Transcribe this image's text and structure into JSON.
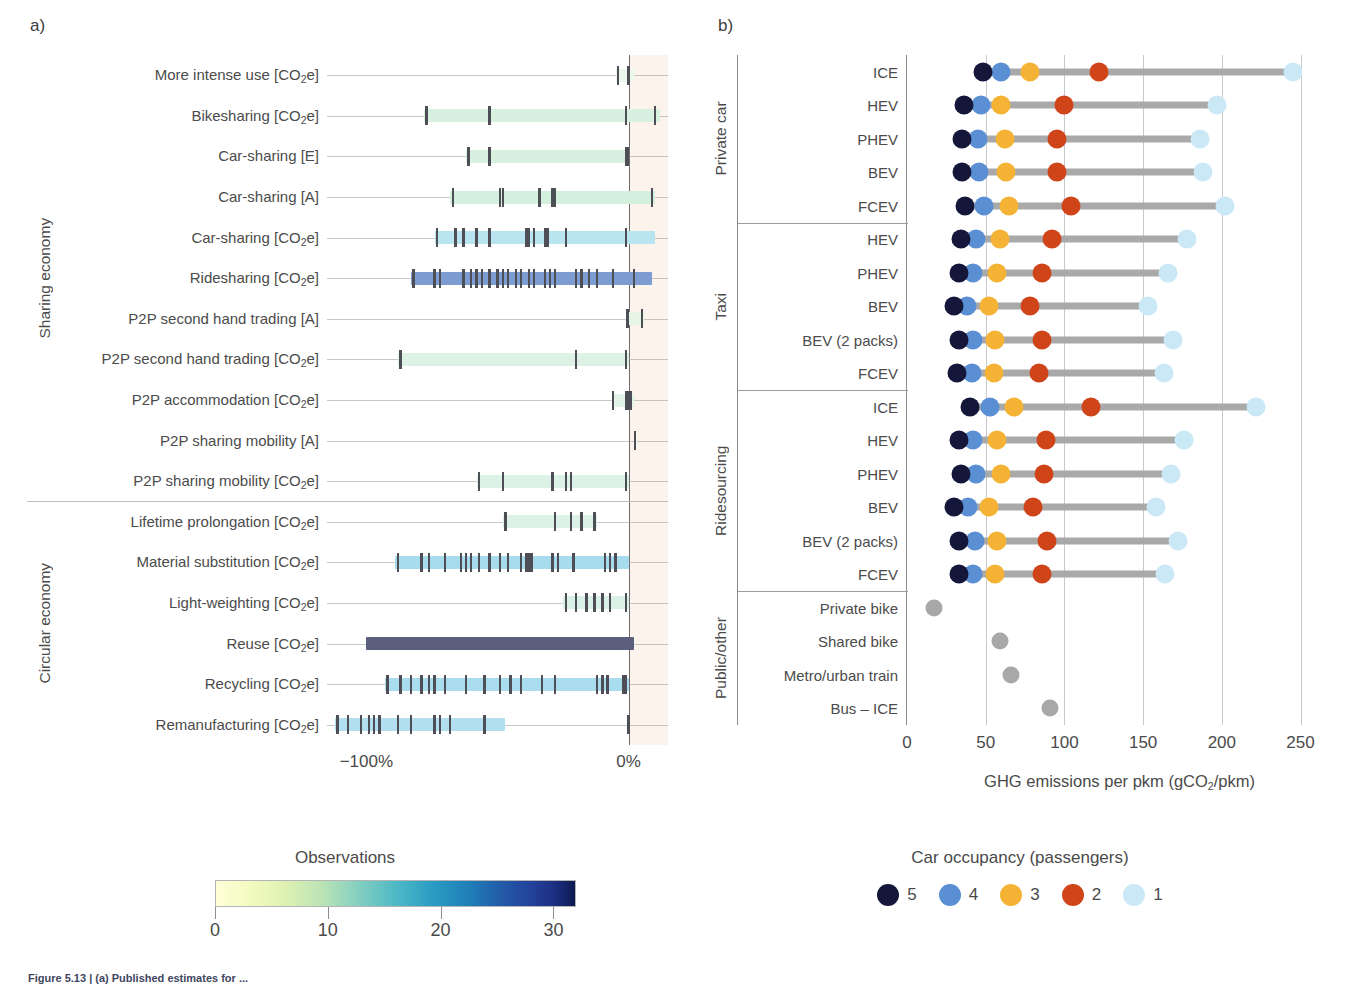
{
  "figure": {
    "panel_a_letter": "a)",
    "panel_b_letter": "b)",
    "caption": "Figure 5.13 | (a) Published estimates for ..."
  },
  "panel_a": {
    "x_ticks": [
      {
        "label": "−100%",
        "value": -100
      },
      {
        "label": "0%",
        "value": 0
      }
    ],
    "categories": [
      {
        "label": "Sharing economy",
        "rows": 11
      },
      {
        "label": "Circular economy",
        "rows": 6
      }
    ],
    "colorbar": {
      "title": "Observations",
      "ticks": [
        "0",
        "10",
        "20",
        "30"
      ],
      "tick_values": [
        0,
        10,
        20,
        30
      ],
      "vmax": 32,
      "colormap": "YlGnBu"
    }
  },
  "panel_b": {
    "x_label": "GHG emissions per pkm (gCO₂/pkm)",
    "x_ticks": [
      "0",
      "50",
      "100",
      "150",
      "200",
      "250"
    ],
    "x_tick_values": [
      0,
      50,
      100,
      150,
      200,
      250
    ],
    "groups": [
      {
        "label": "Private car",
        "rows": 5
      },
      {
        "label": "Taxi",
        "rows": 5
      },
      {
        "label": "Ridesourcing",
        "rows": 6
      },
      {
        "label": "Public/other",
        "rows": 4
      }
    ],
    "legend": {
      "title": "Car occupancy (passengers)",
      "entries": [
        {
          "label": "5",
          "color": "#14173a"
        },
        {
          "label": "4",
          "color": "#5b8fd4"
        },
        {
          "label": "3",
          "color": "#f5b335"
        },
        {
          "label": "2",
          "color": "#cf4418"
        },
        {
          "label": "1",
          "color": "#cbe8f7"
        }
      ]
    }
  },
  "chart_data": [
    {
      "type": "bar",
      "id": "panel-a-ranges",
      "title": "",
      "xlabel": "",
      "ylabel": "",
      "xlim": [
        -115,
        15
      ],
      "xticks": [
        -100,
        0
      ],
      "xticklabels": [
        "−100%",
        "0%"
      ],
      "grid": true,
      "note": "Horizontal range bars (min-max of published estimates) coloured by number of observations (YlGnBu, 0-32); vertical tick marks are individual observations (rug).",
      "rows": [
        {
          "label": "More intense use [CO₂e]",
          "group": "Sharing economy",
          "min": -5,
          "max": 2,
          "observations": 2,
          "color": "#eaf7ea",
          "rug": [
            -4,
            0
          ]
        },
        {
          "label": "Bikesharing [CO₂e]",
          "group": "Sharing economy",
          "min": -78,
          "max": 12,
          "observations": 5,
          "color": "#d7f0e0",
          "rug": [
            -77,
            -53,
            -1,
            10
          ]
        },
        {
          "label": "Car-sharing [E]",
          "group": "Sharing economy",
          "min": -62,
          "max": 0,
          "observations": 4,
          "color": "#d7f0e0",
          "rug": [
            -61,
            -53,
            -1,
            -0.5
          ]
        },
        {
          "label": "Car-sharing [A]",
          "group": "Sharing economy",
          "min": -68,
          "max": 10,
          "observations": 9,
          "color": "#d3efdd",
          "rug": [
            -67,
            -49,
            -48,
            -34,
            -29,
            -28,
            9
          ]
        },
        {
          "label": "Car-sharing [CO₂e]",
          "group": "Sharing economy",
          "min": -74,
          "max": 10,
          "observations": 16,
          "color": "#b8e5ef",
          "rug": [
            -73,
            -66,
            -63,
            -58,
            -53,
            -39,
            -38,
            -36,
            -32,
            -31,
            -24,
            -1
          ]
        },
        {
          "label": "Ridesharing [CO₂e]",
          "group": "Sharing economy",
          "min": -83,
          "max": 9,
          "observations": 28,
          "color": "#7d9dd2",
          "rug": [
            -82,
            -74,
            -72,
            -63,
            -60,
            -58,
            -56,
            -53,
            -50,
            -48,
            -46,
            -43,
            -41,
            -38,
            -36,
            -32,
            -30,
            -28,
            -20,
            -18,
            -15,
            -12,
            -6,
            2
          ]
        },
        {
          "label": "P2P second hand trading [A]",
          "group": "Sharing economy",
          "min": -1,
          "max": 6,
          "observations": 2,
          "color": "#e6f5e4",
          "rug": [
            -0.5,
            5
          ]
        },
        {
          "label": "P2P second hand trading [CO₂e]",
          "group": "Sharing economy",
          "min": -88,
          "max": 0,
          "observations": 3,
          "color": "#ddf2e4",
          "rug": [
            -87,
            -20,
            -1
          ]
        },
        {
          "label": "P2P accommodation [CO₂e]",
          "group": "Sharing economy",
          "min": -6,
          "max": 2,
          "observations": 4,
          "color": "#e2f4e8",
          "rug": [
            -6,
            -1,
            0,
            1
          ]
        },
        {
          "label": "P2P sharing mobility [A]",
          "group": "Sharing economy",
          "min": 2,
          "max": 3,
          "observations": 1,
          "color": "#f2faf0",
          "rug": [
            2.5
          ]
        },
        {
          "label": "P2P sharing mobility [CO₂e]",
          "group": "Sharing economy",
          "min": -58,
          "max": 0,
          "observations": 6,
          "color": "#dcf2e6",
          "rug": [
            -57,
            -48,
            -29,
            -24,
            -22,
            -1
          ]
        },
        {
          "label": "Lifetime prolongation [CO₂e]",
          "group": "Circular economy",
          "min": -48,
          "max": -12,
          "observations": 5,
          "color": "#ddf2e6",
          "rug": [
            -47,
            -28,
            -22,
            -18,
            -13
          ]
        },
        {
          "label": "Material substitution [CO₂e]",
          "group": "Circular economy",
          "min": -89,
          "max": 0,
          "observations": 25,
          "color": "#a6dcee",
          "rug": [
            -88,
            -79,
            -76,
            -70,
            -64,
            -62,
            -60,
            -57,
            -53,
            -49,
            -46,
            -41,
            -39,
            -38,
            -37,
            -29,
            -27,
            -21,
            -9,
            -7,
            -5
          ]
        },
        {
          "label": "Light-weighting [CO₂e]",
          "group": "Circular economy",
          "min": -25,
          "max": 0,
          "observations": 7,
          "color": "#daf1e8",
          "rug": [
            -24,
            -20,
            -16,
            -13,
            -10,
            -7,
            -1
          ]
        },
        {
          "label": "Reuse [CO₂e]",
          "group": "Circular economy",
          "min": -100,
          "max": 2,
          "observations": 32,
          "color": "#5b5f7d",
          "rug": []
        },
        {
          "label": "Recycling [CO₂e]",
          "group": "Circular economy",
          "min": -93,
          "max": 0,
          "observations": 22,
          "color": "#a8dcee",
          "rug": [
            -92,
            -87,
            -83,
            -79,
            -76,
            -74,
            -70,
            -62,
            -55,
            -49,
            -45,
            -41,
            -33,
            -28,
            -12,
            -10,
            -8,
            -2,
            -1
          ]
        },
        {
          "label": "Remanufacturing [CO₂e]",
          "group": "Circular economy",
          "min": -112,
          "max": -47,
          "observations": 20,
          "color": "#b1dff0",
          "rug": [
            -111,
            -107,
            -102,
            -99,
            -97,
            -95,
            -88,
            -83,
            -74,
            -72,
            -68,
            -55,
            0
          ]
        }
      ]
    },
    {
      "type": "scatter",
      "id": "panel-b-lollipop",
      "title": "",
      "xlabel": "GHG emissions per pkm (gCO₂/pkm)",
      "ylabel": "",
      "xlim": [
        0,
        270
      ],
      "xticks": [
        0,
        50,
        100,
        150,
        200,
        250
      ],
      "grid": true,
      "series_names": [
        "5",
        "4",
        "3",
        "2",
        "1"
      ],
      "series_colors": [
        "#14173a",
        "#5b8fd4",
        "#f5b335",
        "#cf4418",
        "#cbe8f7"
      ],
      "rows": [
        {
          "group": "Private car",
          "label": "ICE",
          "values": {
            "5": 48,
            "4": 60,
            "3": 78,
            "2": 122,
            "1": 245
          }
        },
        {
          "group": "Private car",
          "label": "HEV",
          "values": {
            "5": 36,
            "4": 47,
            "3": 60,
            "2": 100,
            "1": 197
          }
        },
        {
          "group": "Private car",
          "label": "PHEV",
          "values": {
            "5": 35,
            "4": 45,
            "3": 62,
            "2": 95,
            "1": 186
          }
        },
        {
          "group": "Private car",
          "label": "BEV",
          "values": {
            "5": 35,
            "4": 46,
            "3": 63,
            "2": 95,
            "1": 188
          }
        },
        {
          "group": "Private car",
          "label": "FCEV",
          "values": {
            "5": 37,
            "4": 49,
            "3": 65,
            "2": 104,
            "1": 202
          }
        },
        {
          "group": "Taxi",
          "label": "HEV",
          "values": {
            "5": 34,
            "4": 44,
            "3": 59,
            "2": 92,
            "1": 178
          }
        },
        {
          "group": "Taxi",
          "label": "PHEV",
          "values": {
            "5": 33,
            "4": 42,
            "3": 57,
            "2": 86,
            "1": 166
          }
        },
        {
          "group": "Taxi",
          "label": "BEV",
          "values": {
            "5": 30,
            "4": 38,
            "3": 52,
            "2": 78,
            "1": 153
          }
        },
        {
          "group": "Taxi",
          "label": "BEV (2 packs)",
          "values": {
            "5": 33,
            "4": 42,
            "3": 56,
            "2": 86,
            "1": 169
          }
        },
        {
          "group": "Taxi",
          "label": "FCEV",
          "values": {
            "5": 32,
            "4": 41,
            "3": 55,
            "2": 84,
            "1": 163
          }
        },
        {
          "group": "Ridesourcing",
          "label": "ICE",
          "values": {
            "5": 40,
            "4": 53,
            "3": 68,
            "2": 117,
            "1": 222
          }
        },
        {
          "group": "Ridesourcing",
          "label": "HEV",
          "values": {
            "5": 33,
            "4": 42,
            "3": 57,
            "2": 88,
            "1": 176
          }
        },
        {
          "group": "Ridesourcing",
          "label": "PHEV",
          "values": {
            "5": 34,
            "4": 44,
            "3": 60,
            "2": 87,
            "1": 168
          }
        },
        {
          "group": "Ridesourcing",
          "label": "BEV",
          "values": {
            "5": 30,
            "4": 39,
            "3": 52,
            "2": 80,
            "1": 158
          }
        },
        {
          "group": "Ridesourcing",
          "label": "BEV (2 packs)",
          "values": {
            "5": 33,
            "4": 43,
            "3": 57,
            "2": 89,
            "1": 172
          }
        },
        {
          "group": "Ridesourcing",
          "label": "FCEV",
          "values": {
            "5": 33,
            "4": 42,
            "3": 56,
            "2": 86,
            "1": 164
          }
        },
        {
          "group": "Public/other",
          "label": "Private bike",
          "single": 17
        },
        {
          "group": "Public/other",
          "label": "Shared bike",
          "single": 59
        },
        {
          "group": "Public/other",
          "label": "Metro/urban train",
          "single": 66
        },
        {
          "group": "Public/other",
          "label": "Bus – ICE",
          "single": 91
        }
      ]
    }
  ]
}
